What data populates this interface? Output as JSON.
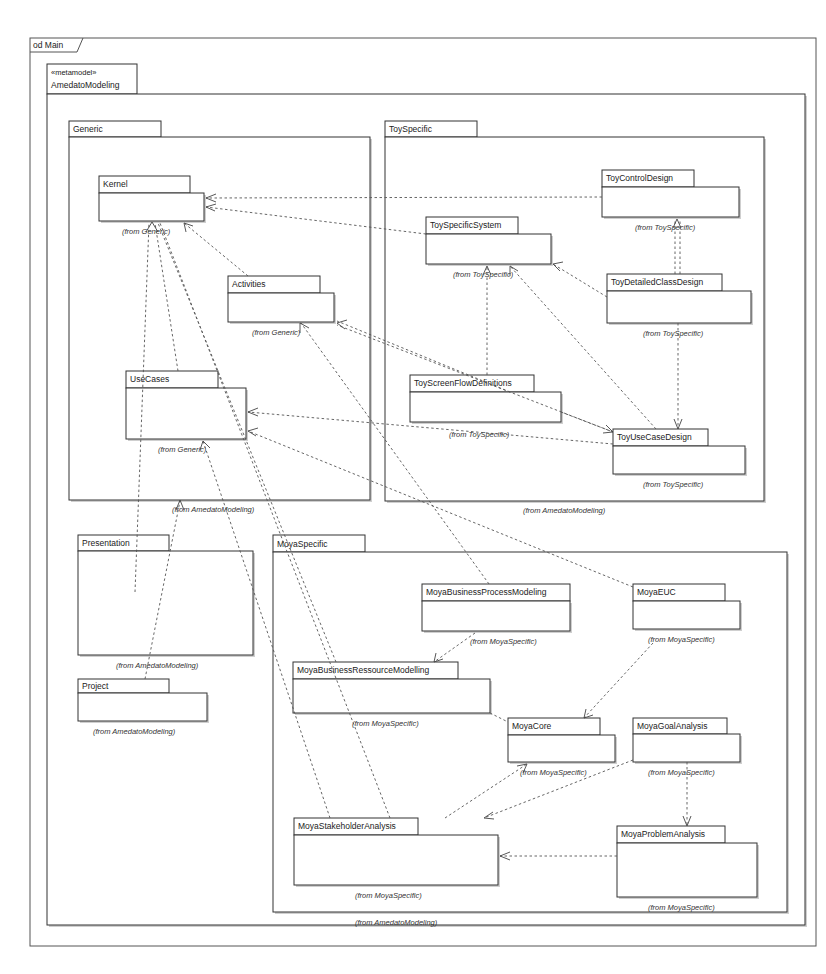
{
  "frame": {
    "label": "od Main"
  },
  "root_package": {
    "stereotype": "«metamodel»",
    "name": "AmedatoModeling"
  },
  "packages": {
    "generic": {
      "name": "Generic",
      "from": "(from AmedatoModeling)"
    },
    "toyspecific": {
      "name": "ToySpecific",
      "from": "(from AmedatoModeling)"
    },
    "moyaspecific": {
      "name": "MoyaSpecific",
      "from": "(from AmedatoModeling)"
    },
    "presentation": {
      "name": "Presentation",
      "from": "(from AmedatoModeling)"
    },
    "project": {
      "name": "Project",
      "from": "(from AmedatoModeling)"
    },
    "kernel": {
      "name": "Kernel",
      "from": "(from Generic)"
    },
    "activities": {
      "name": "Activities",
      "from": "(from Generic)"
    },
    "usecases": {
      "name": "UseCases",
      "from": "(from Generic)"
    },
    "toycontroldesign": {
      "name": "ToyControlDesign",
      "from": "(from ToySpecific)"
    },
    "toyspecificsystem": {
      "name": "ToySpecificSystem",
      "from": "(from ToySpecific)"
    },
    "toydetailedclassdesign": {
      "name": "ToyDetailedClassDesign",
      "from": "(from ToySpecific)"
    },
    "toyscreenflowdefinitions": {
      "name": "ToyScreenFlowDefinitions",
      "from": "(from ToySpecific)"
    },
    "toyusecasedesign": {
      "name": "ToyUseCaseDesign",
      "from": "(from ToySpecific)"
    },
    "moyabusinessprocessmodeling": {
      "name": "MoyaBusinessProcessModeling",
      "from": "(from MoyaSpecific)"
    },
    "moyaeuc": {
      "name": "MoyaEUC",
      "from": "(from MoyaSpecific)"
    },
    "moyabusinessressourcemodelling": {
      "name": "MoyaBusinessRessourceModelling",
      "from": "(from MoyaSpecific)"
    },
    "moyacore": {
      "name": "MoyaCore",
      "from": "(from MoyaSpecific)"
    },
    "moyagoalanalysis": {
      "name": "MoyaGoalAnalysis",
      "from": "(from MoyaSpecific)"
    },
    "moyastakeholderanalysis": {
      "name": "MoyaStakeholderAnalysis",
      "from": "(from MoyaSpecific)"
    },
    "moyaproblemanalysis": {
      "name": "MoyaProblemAnalysis",
      "from": "(from MoyaSpecific)"
    }
  },
  "dependencies": [
    {
      "from": "ToyControlDesign",
      "to": "Kernel"
    },
    {
      "from": "ToySpecificSystem",
      "to": "Kernel"
    },
    {
      "from": "Activities",
      "to": "Kernel"
    },
    {
      "from": "UseCases",
      "to": "Kernel"
    },
    {
      "from": "Presentation",
      "to": "Kernel"
    },
    {
      "from": "MoyaBusinessRessourceModelling",
      "to": "Kernel"
    },
    {
      "from": "MoyaStakeholderAnalysis",
      "to": "Kernel"
    },
    {
      "from": "ToyScreenFlowDefinitions",
      "to": "Activities"
    },
    {
      "from": "ToyUseCaseDesign",
      "to": "Activities"
    },
    {
      "from": "MoyaBusinessProcessModeling",
      "to": "Activities"
    },
    {
      "from": "ToyUseCaseDesign",
      "to": "UseCases"
    },
    {
      "from": "MoyaEUC",
      "to": "UseCases"
    },
    {
      "from": "MoyaStakeholderAnalysis",
      "to": "UseCases"
    },
    {
      "from": "ToyDetailedClassDesign",
      "to": "ToySpecificSystem"
    },
    {
      "from": "ToyScreenFlowDefinitions",
      "to": "ToySpecificSystem"
    },
    {
      "from": "ToyUseCaseDesign",
      "to": "ToySpecificSystem"
    },
    {
      "from": "ToyDetailedClassDesign",
      "to": "ToyControlDesign"
    },
    {
      "from": "ToyDetailedClassDesign",
      "to": "ToyUseCaseDesign"
    },
    {
      "from": "ToyScreenFlowDefinitions",
      "to": "ToyUseCaseDesign"
    },
    {
      "from": "Project",
      "to": "Generic"
    },
    {
      "from": "MoyaBusinessProcessModeling",
      "to": "MoyaBusinessRessourceModelling"
    },
    {
      "from": "MoyaBusinessRessourceModelling",
      "to": "MoyaCore"
    },
    {
      "from": "MoyaEUC",
      "to": "MoyaCore"
    },
    {
      "from": "MoyaStakeholderAnalysis",
      "to": "MoyaCore"
    },
    {
      "from": "MoyaGoalAnalysis",
      "to": "MoyaStakeholderAnalysis"
    },
    {
      "from": "MoyaGoalAnalysis",
      "to": "MoyaProblemAnalysis"
    },
    {
      "from": "MoyaProblemAnalysis",
      "to": "MoyaStakeholderAnalysis"
    }
  ]
}
